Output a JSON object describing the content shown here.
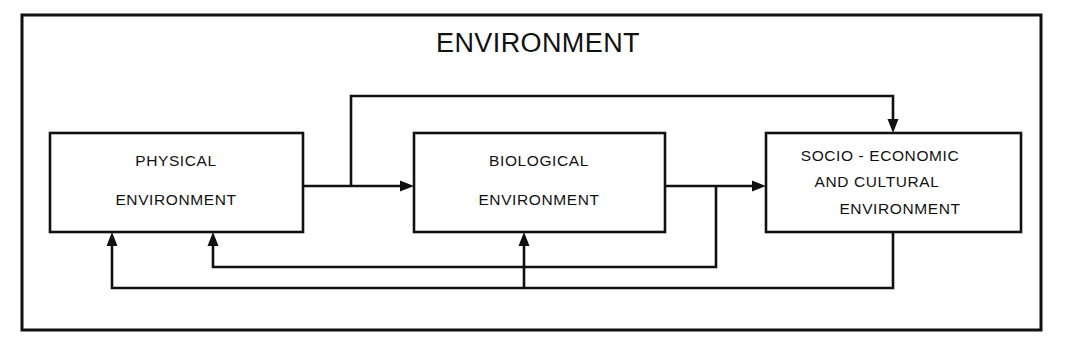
{
  "diagram": {
    "title": "ENVIRONMENT",
    "type": "block-flow-diagram",
    "stroke_color": "#111111",
    "background_color": "#ffffff",
    "nodes": [
      {
        "id": "physical",
        "lines": [
          "PHYSICAL",
          "ENVIRONMENT"
        ]
      },
      {
        "id": "biological",
        "lines": [
          "BIOLOGICAL",
          "ENVIRONMENT"
        ]
      },
      {
        "id": "socio",
        "lines": [
          "SOCIO - ECONOMIC",
          "AND   CULTURAL",
          "ENVIRONMENT"
        ]
      }
    ],
    "connections": [
      {
        "id": "physical-to-biological",
        "from": "physical",
        "to": "biological",
        "direction": "right"
      },
      {
        "id": "physical-to-socio",
        "from": "physical",
        "to": "socio",
        "direction": "over-top-down"
      },
      {
        "id": "biological-to-socio",
        "from": "biological",
        "to": "socio",
        "direction": "right"
      },
      {
        "id": "biological-to-physical",
        "from": "biological",
        "to": "physical",
        "direction": "under-bottom-up"
      },
      {
        "id": "socio-to-physical",
        "from": "socio",
        "to": "physical",
        "direction": "under-bottom-up"
      },
      {
        "id": "socio-to-biological",
        "from": "socio",
        "to": "biological",
        "direction": "under-bottom-up"
      }
    ]
  }
}
